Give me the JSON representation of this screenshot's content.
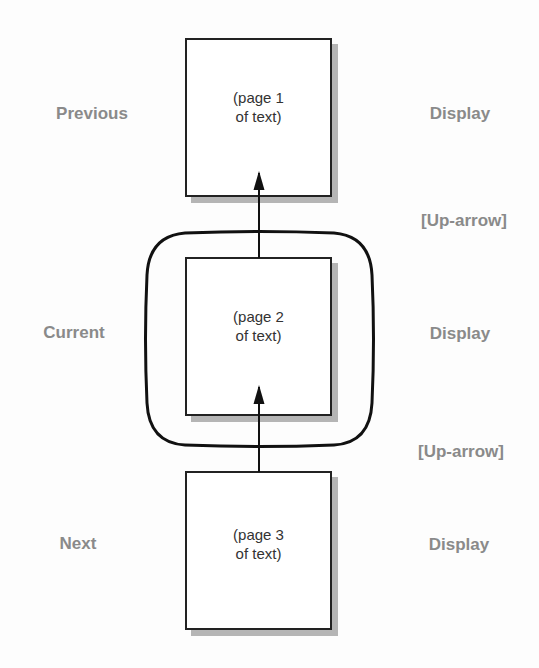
{
  "diagram": {
    "title": "",
    "rows": [
      {
        "id": "previous",
        "left_label": "Previous",
        "box_text_line1": "(page 1",
        "box_text_line2": "of text)",
        "right_label": "Display"
      },
      {
        "id": "current",
        "left_label": "Current",
        "box_text_line1": "(page 2",
        "box_text_line2": "of text)",
        "right_label": "Display",
        "framed_by_screen": true
      },
      {
        "id": "next",
        "left_label": "Next",
        "box_text_line1": "(page 3",
        "box_text_line2": "of text)",
        "right_label": "Display"
      }
    ],
    "transitions": [
      {
        "from": "current",
        "to": "previous",
        "label": "[Up-arrow]",
        "arrow_icon": "up-arrow-icon"
      },
      {
        "from": "next",
        "to": "current",
        "label": "[Up-arrow]",
        "arrow_icon": "up-arrow-icon"
      }
    ],
    "colors": {
      "label_gray": "#8a8a8a",
      "stroke": "#222222",
      "shadow": "#b5b5b5",
      "box_text": "#333333",
      "background": "#fdfdfd"
    }
  }
}
